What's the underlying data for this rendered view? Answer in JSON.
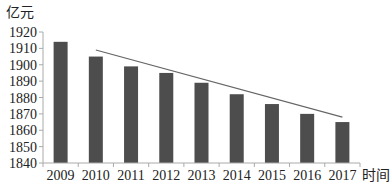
{
  "chart_data": {
    "type": "bar",
    "title": "",
    "ylabel": "亿元",
    "xlabel": "时间",
    "categories": [
      "2009",
      "2010",
      "2011",
      "2012",
      "2013",
      "2014",
      "2015",
      "2016",
      "2017"
    ],
    "values": [
      1914,
      1905,
      1899,
      1895,
      1889,
      1882,
      1876,
      1870,
      1865
    ],
    "ylim": [
      1840,
      1920
    ],
    "yticks": [
      1840,
      1850,
      1860,
      1870,
      1880,
      1890,
      1900,
      1910,
      1920
    ],
    "grid": false,
    "legend": null,
    "trendline": {
      "type": "line",
      "from_category": "2010",
      "to_category": "2017",
      "start_value": 1909,
      "end_value": 1868
    },
    "colors": {
      "bar": "#4d4d4d",
      "trendline": "#666666",
      "axis": "#aaaaaa"
    }
  }
}
